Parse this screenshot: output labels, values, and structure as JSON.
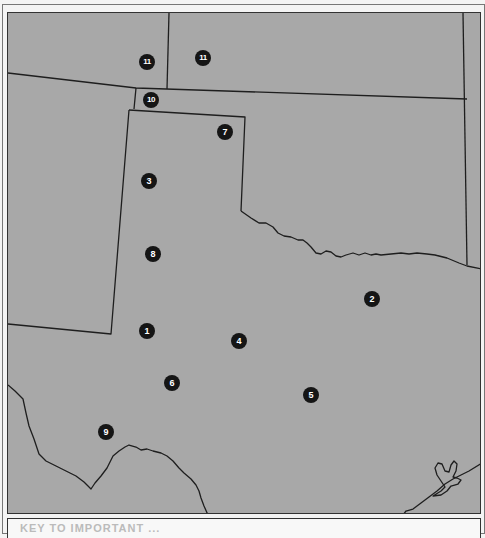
{
  "map": {
    "type": "regional outline map",
    "fill_color": "#a8a8a8",
    "border_color": "#222222",
    "marker_color": "#151515",
    "markers": [
      {
        "label": "11",
        "x": 146,
        "y": 61
      },
      {
        "label": "11",
        "x": 202,
        "y": 57
      },
      {
        "label": "10",
        "x": 150,
        "y": 99
      },
      {
        "label": "7",
        "x": 224,
        "y": 131
      },
      {
        "label": "3",
        "x": 148,
        "y": 180
      },
      {
        "label": "8",
        "x": 152,
        "y": 253
      },
      {
        "label": "2",
        "x": 371,
        "y": 298
      },
      {
        "label": "1",
        "x": 146,
        "y": 330
      },
      {
        "label": "4",
        "x": 238,
        "y": 340
      },
      {
        "label": "6",
        "x": 171,
        "y": 382
      },
      {
        "label": "5",
        "x": 310,
        "y": 394
      },
      {
        "label": "9",
        "x": 105,
        "y": 431
      }
    ]
  },
  "caption": {
    "text": "KEY TO IMPORTANT ..."
  }
}
